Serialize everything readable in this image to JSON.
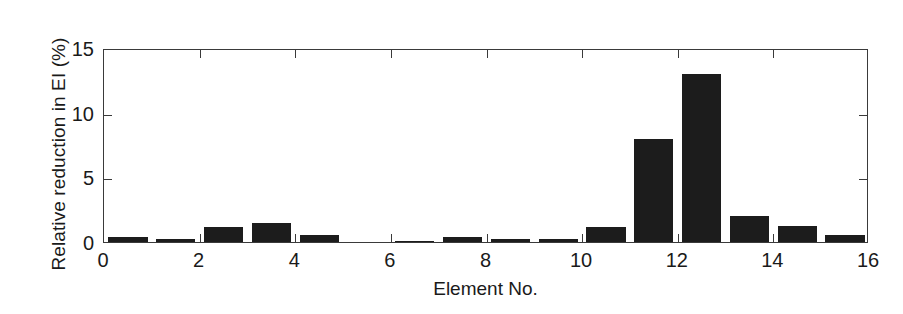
{
  "chart_data": {
    "type": "bar",
    "title": "",
    "xlabel": "Element No.",
    "ylabel": "Relative reduction in EI (%)",
    "categories": [
      1,
      2,
      3,
      4,
      5,
      6,
      7,
      8,
      9,
      10,
      11,
      12,
      13,
      14,
      15,
      16
    ],
    "values": [
      0.35,
      0.25,
      1.15,
      1.45,
      0.55,
      0.0,
      0.1,
      0.4,
      0.22,
      0.25,
      1.15,
      8.0,
      13.0,
      2.05,
      1.2,
      0.55
    ],
    "xlim": [
      0,
      16
    ],
    "ylim": [
      0,
      15
    ],
    "xticks": [
      0,
      2,
      4,
      6,
      8,
      10,
      12,
      14,
      16
    ],
    "xtick_labels": [
      "0",
      "2",
      "4",
      "6",
      "8",
      "10",
      "12",
      "14",
      "16"
    ],
    "yticks": [
      0,
      5,
      10,
      15
    ],
    "ytick_labels": [
      "0",
      "5",
      "10",
      "15"
    ],
    "grid": false,
    "legend": null,
    "bar_color": "#1c1c1c",
    "axis_color": "#3a3a3a",
    "background_color": "#ffffff",
    "bar_width": 0.82
  }
}
